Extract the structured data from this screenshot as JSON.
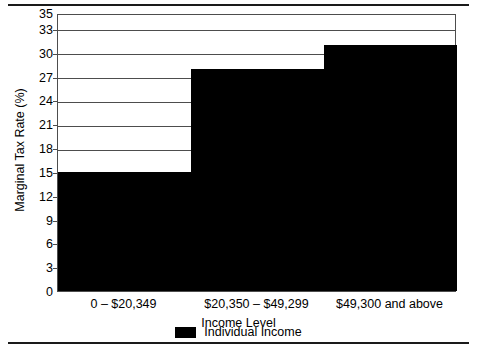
{
  "chart_data": {
    "type": "bar",
    "title": "",
    "subtitle": "",
    "xlabel": "Income Level",
    "ylabel": "Marginal Tax Rate (%)",
    "categories": [
      "0 – $20,349",
      "$20,350 – $49,299",
      "$49,300 and above"
    ],
    "series": [
      {
        "name": "Individual Income",
        "color": "#000000",
        "values": [
          15,
          28,
          31
        ]
      }
    ],
    "values": [
      15,
      28,
      31
    ],
    "ylim": [
      0,
      35
    ],
    "yticks": [
      0,
      3,
      6,
      9,
      12,
      15,
      18,
      21,
      24,
      27,
      30,
      33,
      35
    ],
    "ytick_labels": [
      "0",
      "3",
      "6",
      "9",
      "12",
      "15",
      "18",
      "21",
      "24",
      "27",
      "30",
      "33",
      "35"
    ],
    "grid": true,
    "grid_axis": "y",
    "legend": {
      "position": "bottom",
      "entries": [
        {
          "label": "Individual Income",
          "color": "#000000",
          "swatch": "filled-square"
        }
      ]
    },
    "bar_style": "contiguous-step",
    "axis_color": "#4d4d4d"
  },
  "figure": {
    "rule_top": "horizontal-rule",
    "rule_bottom": "horizontal-rule"
  }
}
